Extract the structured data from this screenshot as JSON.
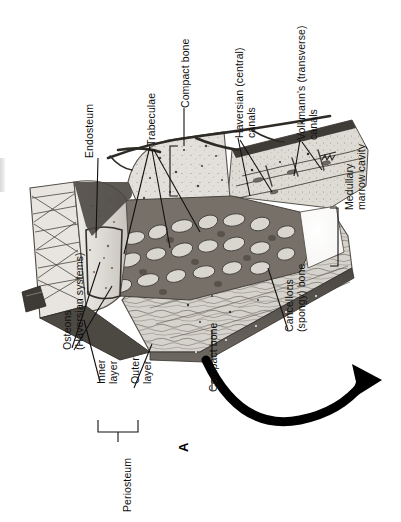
{
  "figure": {
    "figure_letter": "A",
    "orientation": "rotated-90-ccw",
    "background_color": "#ffffff",
    "ink_color": "#111111"
  },
  "labels": [
    {
      "id": "endosteum",
      "text": "Endosteum"
    },
    {
      "id": "trabeculae",
      "text": "Trabeculae"
    },
    {
      "id": "compact-bone-top",
      "text": "Compact bone"
    },
    {
      "id": "haversian",
      "text": "Haversian (central)\ncanals"
    },
    {
      "id": "volkmanns",
      "text": "Volkmann's (transverse)\ncanals"
    },
    {
      "id": "medullary",
      "text": "Medullary\nmarrow cavity"
    },
    {
      "id": "osteons",
      "text": "Osteons\n(Haversian systems)"
    },
    {
      "id": "inner-layer",
      "text": "Inner\nlayer"
    },
    {
      "id": "outer-layer",
      "text": "Outer\nlayer"
    },
    {
      "id": "periosteum",
      "text": "Periosteum"
    },
    {
      "id": "compact-bone-bot",
      "text": "Compact bone"
    },
    {
      "id": "cancellous",
      "text": "Cancellous\n(spongy) bone"
    }
  ],
  "label_text": {
    "endosteum": "Endosteum",
    "trabeculae": "Trabeculae",
    "compact_bone_top": "Compact bone",
    "haversian_line1": "Haversian (central)",
    "haversian_line2": "canals",
    "volkmanns_line1": "Volkmann's (transverse)",
    "volkmanns_line2": "canals",
    "medullary_line1": "Medullary",
    "medullary_line2": "marrow cavity",
    "osteons_line1": "Osteons",
    "osteons_line2": "(Haversian systems)",
    "inner_line1": "Inner",
    "inner_line2": "layer",
    "outer_line1": "Outer",
    "outer_line2": "layer",
    "periosteum": "Periosteum",
    "compact_bone_bottom": "Compact bone",
    "cancellous_line1": "Cancellous",
    "cancellous_line2": "(spongy) bone",
    "figure_letter": "A"
  }
}
